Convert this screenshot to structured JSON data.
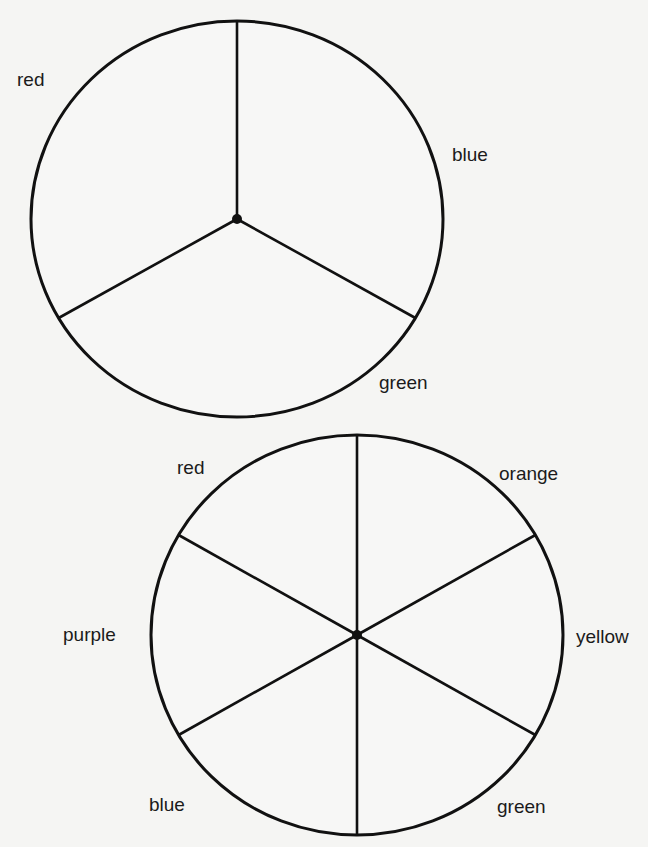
{
  "diagram": {
    "wheels": [
      {
        "name": "primary-color-wheel",
        "center": {
          "x": 237,
          "y": 219
        },
        "radius": {
          "rx": 206,
          "ry": 198
        },
        "segments": 3,
        "spoke_angles_deg": [
          270,
          30,
          150
        ],
        "labels": [
          {
            "text": "red",
            "x": 17,
            "y": 70
          },
          {
            "text": "blue",
            "x": 452,
            "y": 145
          },
          {
            "text": "green",
            "x": 379,
            "y": 373
          }
        ]
      },
      {
        "name": "secondary-color-wheel",
        "center": {
          "x": 357,
          "y": 635
        },
        "radius": {
          "rx": 206,
          "ry": 200
        },
        "segments": 6,
        "spoke_angles_deg": [
          270,
          330,
          30,
          90,
          150,
          210
        ],
        "labels": [
          {
            "text": "red",
            "x": 177,
            "y": 458
          },
          {
            "text": "orange",
            "x": 499,
            "y": 464
          },
          {
            "text": "yellow",
            "x": 576,
            "y": 627
          },
          {
            "text": "green",
            "x": 497,
            "y": 797
          },
          {
            "text": "blue",
            "x": 149,
            "y": 795
          },
          {
            "text": "purple",
            "x": 63,
            "y": 625
          }
        ]
      }
    ],
    "stroke_color": "#111111",
    "background_color": "#f5f5f3"
  }
}
